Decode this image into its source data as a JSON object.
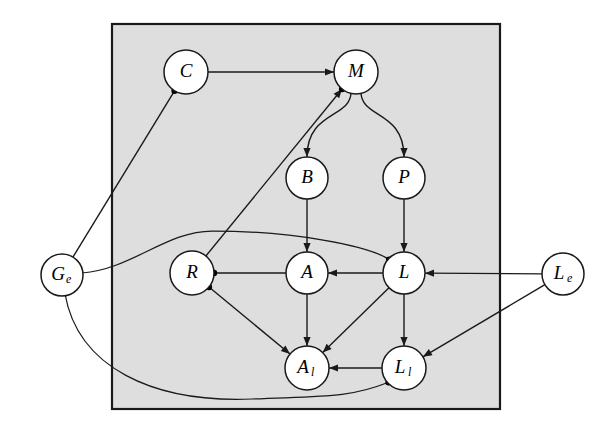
{
  "figure": {
    "type": "directed-graph",
    "title": "",
    "background": "#ffffff",
    "plate": {
      "name": "plate",
      "fill": "#dedede",
      "stroke": "#1a1a1a",
      "x": 112,
      "y": 24,
      "width": 388,
      "height": 385
    }
  },
  "nodes": [
    {
      "id": "C",
      "label": "C",
      "sub": "",
      "cx": 186,
      "cy": 72,
      "r": 22,
      "inside_plate": true
    },
    {
      "id": "M",
      "label": "M",
      "sub": "",
      "cx": 356,
      "cy": 72,
      "r": 22,
      "inside_plate": true
    },
    {
      "id": "B",
      "label": "B",
      "sub": "",
      "cx": 307,
      "cy": 178,
      "r": 21,
      "inside_plate": true
    },
    {
      "id": "P",
      "label": "P",
      "sub": "",
      "cx": 404,
      "cy": 178,
      "r": 21,
      "inside_plate": true
    },
    {
      "id": "R",
      "label": "R",
      "sub": "",
      "cx": 192,
      "cy": 273,
      "r": 22,
      "inside_plate": true
    },
    {
      "id": "A",
      "label": "A",
      "sub": "",
      "cx": 307,
      "cy": 273,
      "r": 21,
      "inside_plate": true
    },
    {
      "id": "L",
      "label": "L",
      "sub": "",
      "cx": 404,
      "cy": 273,
      "r": 21,
      "inside_plate": true
    },
    {
      "id": "Al",
      "label": "A",
      "sub": "l",
      "cx": 307,
      "cy": 368,
      "r": 22,
      "inside_plate": true
    },
    {
      "id": "Ll",
      "label": "L",
      "sub": "l",
      "cx": 404,
      "cy": 368,
      "r": 22,
      "inside_plate": true
    },
    {
      "id": "Ge",
      "label": "G",
      "sub": "e",
      "cx": 62,
      "cy": 275,
      "r": 21,
      "inside_plate": false
    },
    {
      "id": "Le",
      "label": "L",
      "sub": "e",
      "cx": 563,
      "cy": 274,
      "r": 21,
      "inside_plate": false
    }
  ],
  "edges": [
    {
      "from": "C",
      "to": "M",
      "arrow": true,
      "style": "straight"
    },
    {
      "from": "C",
      "to": "Ge",
      "arrow": false,
      "style": "straight",
      "source_dot": true
    },
    {
      "from": "R",
      "to": "M",
      "arrow": true,
      "style": "straight",
      "target_dot": true
    },
    {
      "from": "M",
      "to": "B",
      "arrow": true,
      "style": "curved"
    },
    {
      "from": "M",
      "to": "P",
      "arrow": true,
      "style": "curved"
    },
    {
      "from": "B",
      "to": "A",
      "arrow": true,
      "style": "straight"
    },
    {
      "from": "P",
      "to": "L",
      "arrow": true,
      "style": "straight"
    },
    {
      "from": "R",
      "to": "A",
      "arrow": false,
      "style": "straight",
      "source_dot": true
    },
    {
      "from": "L",
      "to": "A",
      "arrow": true,
      "style": "straight"
    },
    {
      "from": "Le",
      "to": "L",
      "arrow": true,
      "style": "straight"
    },
    {
      "from": "Ge",
      "to": "L",
      "arrow": false,
      "style": "curved",
      "target_dot": true
    },
    {
      "from": "R",
      "to": "Al",
      "arrow": true,
      "style": "straight",
      "source_dot": true
    },
    {
      "from": "A",
      "to": "Al",
      "arrow": true,
      "style": "straight"
    },
    {
      "from": "L",
      "to": "Al",
      "arrow": true,
      "style": "straight"
    },
    {
      "from": "L",
      "to": "Ll",
      "arrow": true,
      "style": "straight"
    },
    {
      "from": "Ll",
      "to": "Al",
      "arrow": true,
      "style": "straight"
    },
    {
      "from": "Le",
      "to": "Ll",
      "arrow": true,
      "style": "straight"
    },
    {
      "from": "Ge",
      "to": "Ll",
      "arrow": false,
      "style": "curved",
      "target_dot": true
    }
  ],
  "colors": {
    "plate_fill": "#dedede",
    "stroke": "#1a1a1a",
    "node_fill": "#ffffff",
    "dot": "#000000"
  }
}
